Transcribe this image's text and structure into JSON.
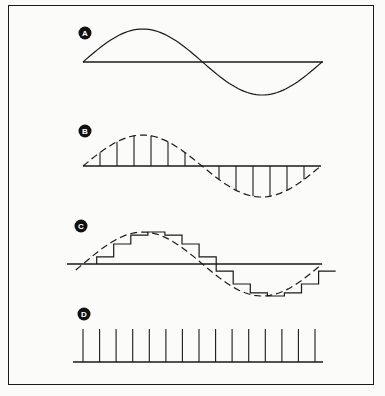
{
  "figure": {
    "panels": [
      {
        "label": "A",
        "description": "continuous sine wave",
        "style": "solid"
      },
      {
        "label": "B",
        "description": "sine wave (dashed) with sample lines",
        "style": "dashed-with-samples"
      },
      {
        "label": "C",
        "description": "sine wave (dashed) with staircase sample-and-hold approximation",
        "style": "dashed-with-staircase"
      },
      {
        "label": "D",
        "description": "uniform sampling pulse train",
        "style": "impulse-train",
        "pulse_count": 15
      }
    ],
    "colors": {
      "ink": "#1a1a1a",
      "paper": "#fbfbf9"
    }
  }
}
